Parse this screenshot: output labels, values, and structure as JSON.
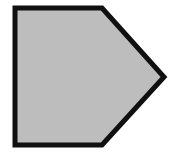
{
  "canvas": {
    "width": 174,
    "height": 160,
    "background_color": "#FFFFFF",
    "label": "pentagon-figure-canvas"
  },
  "shape": {
    "name": "pentagon",
    "description": "Irregular convex pentagon resembling a rightward-pointing home-plate / arrow-block outline",
    "fill_color": "#BDBDBD",
    "stroke_color": "#101010",
    "stroke_width": 5,
    "vertex_count": 5,
    "vertices": [
      {
        "label": "top-left",
        "x": 15,
        "y": 8
      },
      {
        "label": "top-right",
        "x": 102,
        "y": 8
      },
      {
        "label": "right-apex",
        "x": 164,
        "y": 77
      },
      {
        "label": "bottom-right",
        "x": 102,
        "y": 145
      },
      {
        "label": "bottom-left",
        "x": 15,
        "y": 145
      }
    ],
    "points_attr": "15,8 102,8 164,77 102,145 15,145"
  }
}
